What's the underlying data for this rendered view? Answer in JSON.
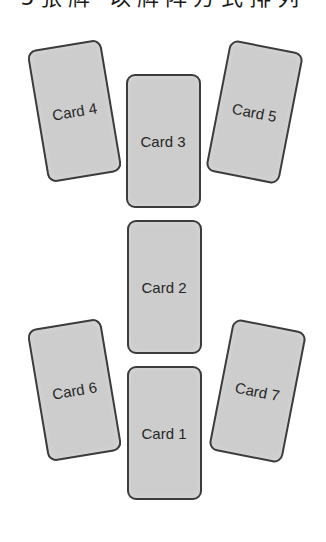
{
  "caption": {
    "text": "5张牌·以牌阵方式排列",
    "clipped": true
  },
  "layout": {
    "card_fill": "#cdcdcd",
    "card_border": "#3c3c3c",
    "label_color": "#262626"
  },
  "cards": [
    {
      "id": "card-1",
      "label": "Card 1",
      "center_x": 164,
      "center_y": 433,
      "rotation_deg": 0
    },
    {
      "id": "card-2",
      "label": "Card 2",
      "center_x": 164,
      "center_y": 287,
      "rotation_deg": 0
    },
    {
      "id": "card-3",
      "label": "Card 3",
      "center_x": 163,
      "center_y": 141,
      "rotation_deg": 0
    },
    {
      "id": "card-4",
      "label": "Card 4",
      "center_x": 74,
      "center_y": 111,
      "rotation_deg": -9.5
    },
    {
      "id": "card-5",
      "label": "Card 5",
      "center_x": 254,
      "center_y": 112,
      "rotation_deg": 11
    },
    {
      "id": "card-6",
      "label": "Card 6",
      "center_x": 74,
      "center_y": 390,
      "rotation_deg": -9.5
    },
    {
      "id": "card-7",
      "label": "Card 7",
      "center_x": 257,
      "center_y": 391,
      "rotation_deg": 11
    }
  ]
}
